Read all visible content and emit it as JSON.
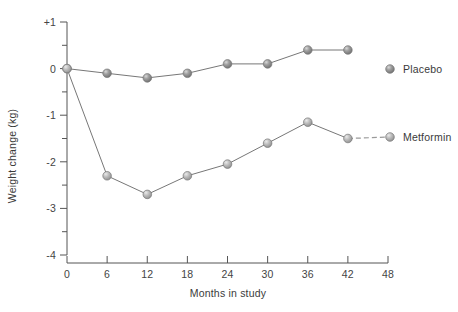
{
  "chart_data": {
    "type": "line",
    "title": "",
    "xlabel": "Months in study",
    "ylabel": "Weight change (kg)",
    "xlim": [
      0,
      48
    ],
    "ylim": [
      -4,
      1
    ],
    "grid": false,
    "legend_position": "right",
    "x": [
      0,
      6,
      12,
      18,
      24,
      30,
      36,
      42
    ],
    "xticks": [
      "0",
      "6",
      "12",
      "18",
      "24",
      "30",
      "36",
      "42",
      "48"
    ],
    "xtick_values": [
      0,
      6,
      12,
      18,
      24,
      30,
      36,
      42,
      48
    ],
    "yticks": [
      "+1",
      "0",
      "-1",
      "-2",
      "-3",
      "-4"
    ],
    "ytick_values": [
      1,
      0,
      -1,
      -2,
      -3,
      -4
    ],
    "yminor_values": [
      0.5,
      -0.5,
      -1.5,
      -2.5,
      -3.5
    ],
    "series": [
      {
        "name": "Placebo",
        "color": "#8c8c8c",
        "values": [
          0,
          -0.1,
          -0.2,
          -0.1,
          0.1,
          0.1,
          0.4,
          0.4
        ],
        "dashed_tail": false
      },
      {
        "name": "Metformin",
        "color": "#a8a8a8",
        "values": [
          0,
          -2.3,
          -2.7,
          -2.3,
          -2.05,
          -1.6,
          -1.15,
          -1.5
        ],
        "dashed_tail": true
      }
    ],
    "legend": [
      {
        "label": "Placebo",
        "marker": "sphere-marker-dark"
      },
      {
        "label": "Metformin",
        "marker": "sphere-marker-light"
      }
    ]
  }
}
